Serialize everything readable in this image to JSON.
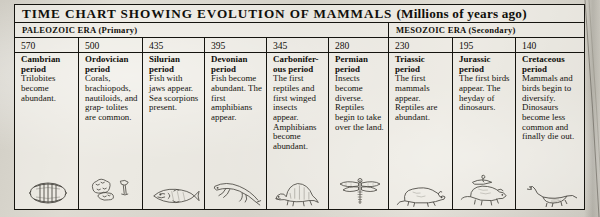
{
  "title": {
    "main": "TIME CHART SHOWING EVOLUTION OF MAMMALS",
    "paren": "(Millions of years ago)"
  },
  "eras": [
    {
      "label": "PALEOZOIC ERA (Primary)"
    },
    {
      "label": "MESOZOIC ERA (Secondary)"
    }
  ],
  "columns": [
    {
      "year": "570",
      "period": "Cambrian period",
      "description": "Trilobites become abundant.",
      "figure": "trilobite-icon"
    },
    {
      "year": "500",
      "period": "Ordovician period",
      "description": "Corals, brachiopods, nautiloids, and grap- tolites are common.",
      "figure": "coral-brachiopod-icon"
    },
    {
      "year": "435",
      "period": "Silurian period",
      "description": "Fish with jaws appear. Sea scorpions present.",
      "figure": "jawed-fish-icon"
    },
    {
      "year": "395",
      "period": "Devonian period",
      "description": "Fish become abundant. The first amphibians appear.",
      "figure": "amphibian-icon"
    },
    {
      "year": "345",
      "period": "Carbonifer- ous period",
      "description": "The first reptiles and first winged insects appear. Amphibians become abundant.",
      "figure": "sail-back-reptile-icon"
    },
    {
      "year": "280",
      "period": "Permian period",
      "description": "Insects become diverse. Reptiles begin to take over the land.",
      "figure": "dragonfly-icon"
    },
    {
      "year": "230",
      "period": "Triassic period",
      "description": "The first mammals appear. Reptiles are abundant.",
      "figure": "early-mammal-icon"
    },
    {
      "year": "195",
      "period": "Jurassic period",
      "description": "The first birds appear. The heyday of dinosaurs.",
      "figure": "horned-dinosaur-bird-icon"
    },
    {
      "year": "140",
      "period": "Cretaceous period",
      "description": "Mammals and birds begin to diversify. Dinosaurs become less common and finally die out.",
      "figure": "sauropod-icon"
    }
  ],
  "colors": {
    "ink": "#15140f",
    "paper": "#dedbd2"
  }
}
